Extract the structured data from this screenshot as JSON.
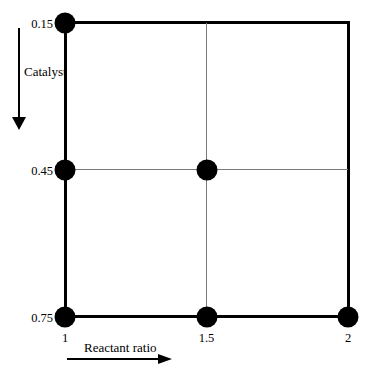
{
  "chart_data": {
    "type": "scatter",
    "title": "",
    "xlabel": "Reactant ratio",
    "ylabel": "Catalyst",
    "x_range": [
      1,
      2
    ],
    "y_range": [
      0.15,
      0.75
    ],
    "y_axis_inverted": true,
    "x_axis_arrow_direction": "right",
    "y_axis_arrow_direction": "down",
    "x_ticks": [
      {
        "value": 1,
        "label": "1"
      },
      {
        "value": 1.5,
        "label": "1.5"
      },
      {
        "value": 2,
        "label": "2"
      }
    ],
    "y_ticks": [
      {
        "value": 0.15,
        "label": "0.15"
      },
      {
        "value": 0.45,
        "label": "0.45"
      },
      {
        "value": 0.75,
        "label": "0.75"
      }
    ],
    "points": [
      {
        "x": 1,
        "y": 0.15
      },
      {
        "x": 1,
        "y": 0.45
      },
      {
        "x": 1.5,
        "y": 0.45
      },
      {
        "x": 1,
        "y": 0.75
      },
      {
        "x": 1.5,
        "y": 0.75
      },
      {
        "x": 2,
        "y": 0.75
      }
    ],
    "grid": {
      "vertical_x": [
        1.5
      ],
      "horizontal_y": [
        0.45
      ]
    },
    "colors": {
      "point": "#000000",
      "frame": "#000000",
      "grid": "#7a7a7a",
      "text": "#000000",
      "background": "#ffffff"
    }
  }
}
